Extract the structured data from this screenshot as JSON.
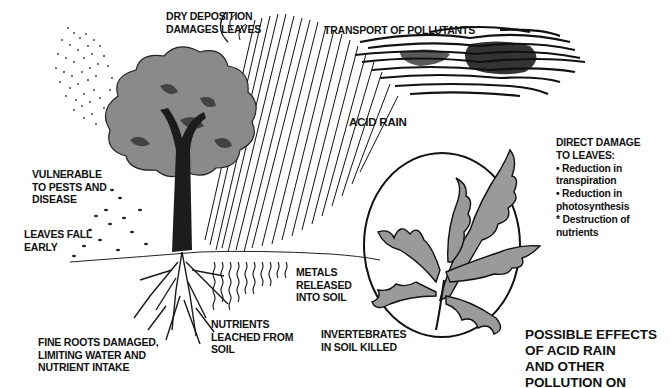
{
  "diagram": {
    "title_lines": [
      "POSSIBLE EFFECTS",
      "OF ACID RAIN",
      "AND OTHER",
      "POLLUTION ON"
    ],
    "labels": {
      "dry_deposition": [
        "DRY DEPOSITION",
        "DAMAGES LEAVES"
      ],
      "transport": [
        "TRANSPORT OF POLLUTANTS"
      ],
      "acid_rain": [
        "ACID RAIN"
      ],
      "vulnerable": [
        "VULNERABLE",
        "TO PESTS AND",
        "DISEASE"
      ],
      "leaves_fall": [
        "LEAVES FALL",
        "EARLY"
      ],
      "metals": [
        "METALS",
        "RELEASED",
        "INTO SOIL"
      ],
      "nutrients": [
        "NUTRIENTS",
        "LEACHED FROM",
        "SOIL"
      ],
      "fine_roots": [
        "FINE ROOTS DAMAGED,",
        "LIMITING WATER AND",
        "NUTRIENT INTAKE"
      ],
      "invertebrates": [
        "INVERTEBRATES",
        "IN SOIL KILLED"
      ]
    },
    "direct_damage": {
      "heading": [
        "DIRECT DAMAGE",
        "TO LEAVES:"
      ],
      "items": [
        "• Reduction in",
        "transpiration",
        "• Reduction in",
        "photosynthesis",
        "* Destruction of",
        "nutrients"
      ]
    },
    "colors": {
      "ink": "#111111",
      "foliage": "#8a8a8a",
      "leaf": "#9a9a9a",
      "background": "#ffffff"
    },
    "icons": [
      "tree-illustration",
      "oak-leaf-illustration",
      "rain-streaks",
      "pollution-cloud",
      "dry-deposition-dots",
      "roots",
      "falling-leaves"
    ]
  }
}
